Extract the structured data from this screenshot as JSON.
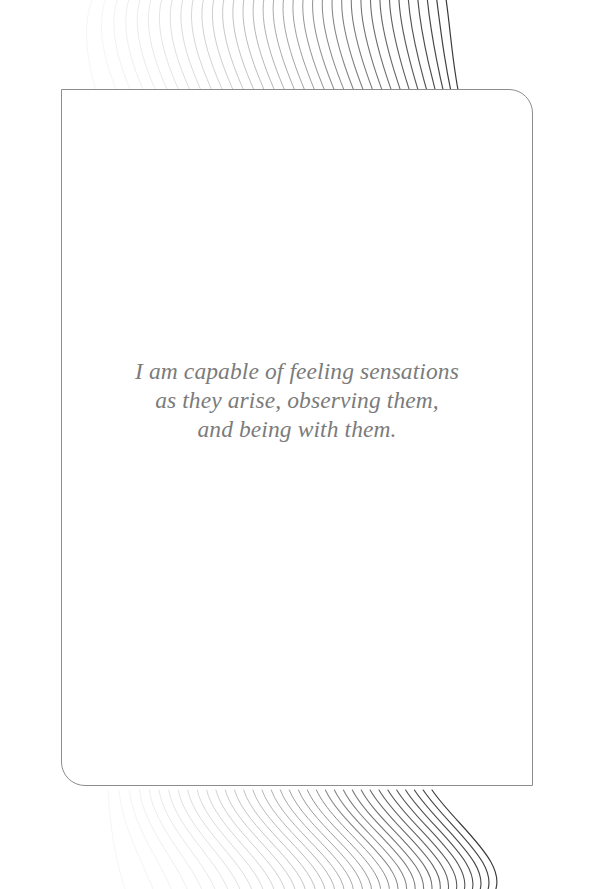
{
  "page": {
    "background_color": "#ffffff",
    "width": 589,
    "height": 889
  },
  "card": {
    "background_color": "#ffffff",
    "border_color": "#8d8d8d",
    "corner_style": "sharp-top-left-and-bottom-right, rounded-top-right-and-bottom-left"
  },
  "quote": {
    "text_color": "#7b7b7b",
    "full_text": "I am capable of feeling sensations as they arise, observing them, and being with them.",
    "lines": [
      "I am capable of feeling sensations",
      "as they arise, observing them,",
      "and being with them."
    ]
  },
  "decoration": {
    "top_wave": {
      "name": "wave-fan-top",
      "line_count": 36,
      "color_light": "#f2f2f2",
      "color_dark": "#3a3a3a"
    },
    "bottom_wave": {
      "name": "wave-fan-bottom",
      "line_count": 36,
      "color_light": "#f2f2f2",
      "color_dark": "#3a3a3a"
    }
  }
}
